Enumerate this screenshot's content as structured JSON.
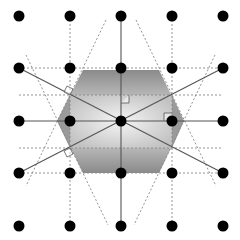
{
  "diagram": {
    "title": "",
    "type": "geometric-lattice-construction",
    "lattice": {
      "xs": [
        19,
        70,
        121,
        172,
        223
      ],
      "ys": [
        16,
        68,
        121,
        173,
        226
      ],
      "dot_radius": 5.5,
      "dot_color": "#000000"
    },
    "hexagon": {
      "points": [
        [
          83,
          70
        ],
        [
          159,
          70
        ],
        [
          184,
          121
        ],
        [
          159,
          173
        ],
        [
          83,
          173
        ],
        [
          57,
          121
        ]
      ],
      "fill_outer": "#7a7a7a",
      "fill_inner": "#e8e8e8"
    },
    "inner_rectangle": {
      "x": 70,
      "y": 95,
      "width": 102,
      "height": 53,
      "fill_edge": "#a8a8a8",
      "fill_center": "#f2f2f2"
    },
    "solid_lines": [
      {
        "x1": 19,
        "y1": 121,
        "x2": 223,
        "y2": 121
      },
      {
        "x1": 121,
        "y1": 16,
        "x2": 121,
        "y2": 226
      },
      {
        "x1": 19,
        "y1": 68,
        "x2": 223,
        "y2": 173
      },
      {
        "x1": 19,
        "y1": 173,
        "x2": 223,
        "y2": 68
      }
    ],
    "dashed_lines": [
      {
        "x1": 19,
        "y1": 68,
        "x2": 223,
        "y2": 68
      },
      {
        "x1": 19,
        "y1": 95,
        "x2": 223,
        "y2": 95
      },
      {
        "x1": 19,
        "y1": 148,
        "x2": 223,
        "y2": 148
      },
      {
        "x1": 19,
        "y1": 173,
        "x2": 223,
        "y2": 173
      },
      {
        "x1": 70,
        "y1": 16,
        "x2": 70,
        "y2": 226
      },
      {
        "x1": 172,
        "y1": 16,
        "x2": 172,
        "y2": 226
      },
      {
        "x1": 106,
        "y1": 20,
        "x2": 26,
        "y2": 186
      },
      {
        "x1": 136,
        "y1": 20,
        "x2": 216,
        "y2": 186
      },
      {
        "x1": 26,
        "y1": 55,
        "x2": 108,
        "y2": 225
      },
      {
        "x1": 215,
        "y1": 55,
        "x2": 134,
        "y2": 225
      }
    ],
    "right_angle_marks": [
      {
        "x": 121,
        "y": 95,
        "size": 8,
        "dir": "right-up"
      },
      {
        "x": 172,
        "y": 121,
        "size": 8,
        "dir": "left-up"
      },
      {
        "x": 70,
        "y": 95,
        "size": 7,
        "dir": "diag-upper-left"
      },
      {
        "x": 70,
        "y": 148,
        "size": 7,
        "dir": "diag-lower-left"
      }
    ],
    "line_color_solid": "#555555",
    "line_color_dashed": "#888888"
  }
}
